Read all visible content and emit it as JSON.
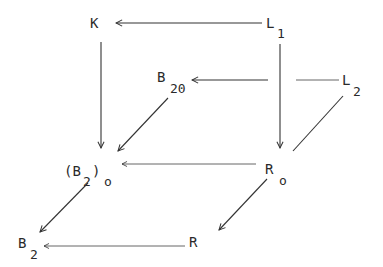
{
  "diagram": {
    "type": "commutative-cube-diagram",
    "nodes": {
      "K": {
        "label": "K",
        "subscript": ""
      },
      "L1": {
        "label": "L",
        "subscript": "1"
      },
      "B20": {
        "label": "B",
        "subscript": "20"
      },
      "L2": {
        "label": "L",
        "subscript": "2"
      },
      "B2o": {
        "label": "(B",
        "subscript": "2",
        "close": ")",
        "sub2": "o"
      },
      "Ro": {
        "label": "R",
        "subscript": "o"
      },
      "B2": {
        "label": "B",
        "subscript": "2"
      },
      "R": {
        "label": "R",
        "subscript": ""
      }
    },
    "edges": [
      {
        "from": "L1",
        "to": "K",
        "direction": "left"
      },
      {
        "from": "K",
        "to": "B2o",
        "direction": "down"
      },
      {
        "from": "L1",
        "to": "Ro",
        "direction": "down"
      },
      {
        "from": "L2",
        "to": "B20",
        "direction": "left"
      },
      {
        "from": "B20",
        "to": "B2o",
        "direction": "diagonal-down-left"
      },
      {
        "from": "L2",
        "to": "Ro",
        "direction": "diagonal-down-left",
        "arrowhead": false
      },
      {
        "from": "Ro",
        "to": "B2o",
        "direction": "left"
      },
      {
        "from": "Ro",
        "to": "R",
        "direction": "diagonal-down-left"
      },
      {
        "from": "B2o",
        "to": "B2",
        "direction": "diagonal-down-left"
      },
      {
        "from": "R",
        "to": "B2",
        "direction": "left"
      }
    ],
    "colors": {
      "ink": "#2a2a2a",
      "background": "#ffffff"
    }
  }
}
